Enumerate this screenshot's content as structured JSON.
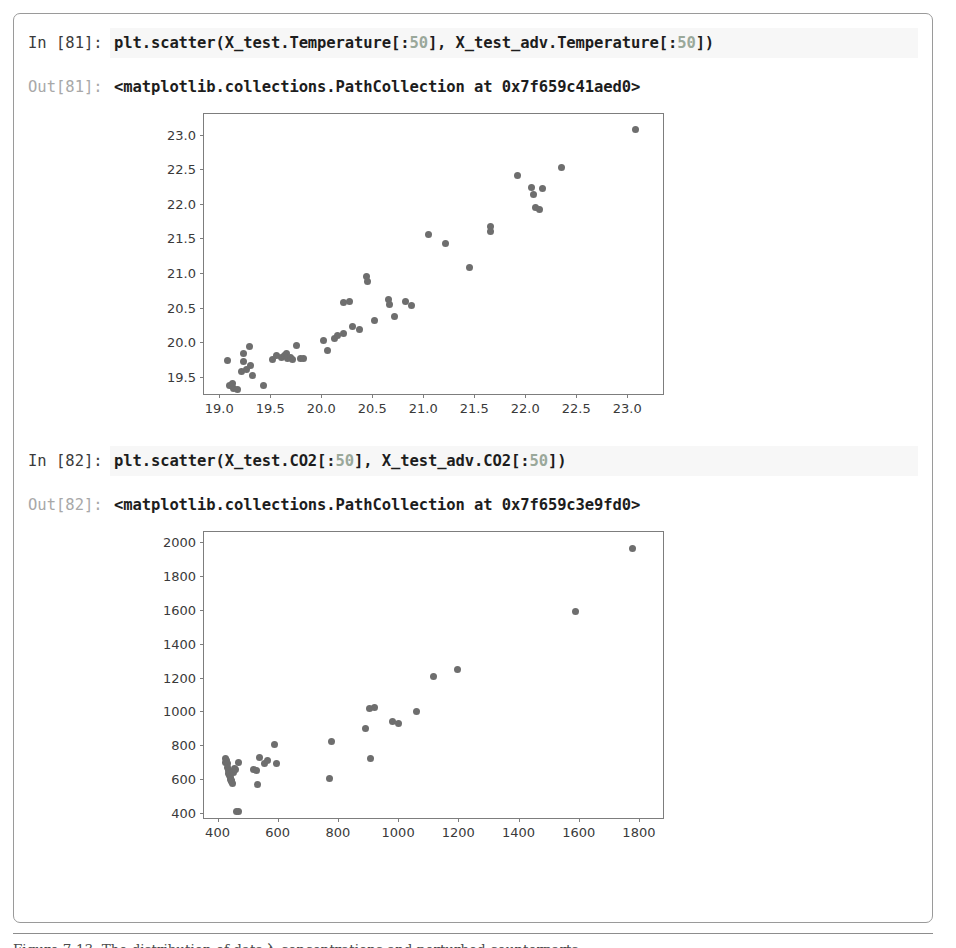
{
  "document": {
    "caption": "Figure 7-13. The distribution of data入 concentrations and perturbed counterparts"
  },
  "notebook": {
    "cells": [
      {
        "in_prompt": "In [81]:",
        "code_prefix": "plt.scatter(X_test.Temperature[:",
        "code_number": "50",
        "code_middle": "], X_test_adv.Temperature[:",
        "code_number2": "50",
        "code_suffix": "])",
        "out_prompt": "Out[81]:",
        "out_text": "<matplotlib.collections.PathCollection at 0x7f659c41aed0>"
      },
      {
        "in_prompt": "In [82]:",
        "code_prefix": "plt.scatter(X_test.CO2[:",
        "code_number": "50",
        "code_middle": "], X_test_adv.CO2[:",
        "code_number2": "50",
        "code_suffix": "])",
        "out_prompt": "Out[82]:",
        "out_text": "<matplotlib.collections.PathCollection at 0x7f659c3e9fd0>"
      }
    ]
  },
  "chart_data": [
    {
      "type": "scatter",
      "title": "",
      "xlabel": "",
      "ylabel": "",
      "xlim": [
        18.85,
        23.35
      ],
      "ylim": [
        19.25,
        23.3
      ],
      "xticks": [
        "19.0",
        "19.5",
        "20.0",
        "20.5",
        "21.0",
        "21.5",
        "22.0",
        "22.5",
        "23.0"
      ],
      "xtickvals": [
        19.0,
        19.5,
        20.0,
        20.5,
        21.0,
        21.5,
        22.0,
        22.5,
        23.0
      ],
      "yticks": [
        "19.5",
        "20.0",
        "20.5",
        "21.0",
        "21.5",
        "22.0",
        "22.5",
        "23.0"
      ],
      "ytickvals": [
        19.5,
        20.0,
        20.5,
        21.0,
        21.5,
        22.0,
        22.5,
        23.0
      ],
      "grid": false,
      "legend": null,
      "marker_color": "#6e6e6e",
      "points": [
        [
          19.08,
          19.73
        ],
        [
          19.1,
          19.37
        ],
        [
          19.13,
          19.4
        ],
        [
          19.14,
          19.33
        ],
        [
          19.18,
          19.32
        ],
        [
          19.24,
          19.84
        ],
        [
          19.24,
          19.72
        ],
        [
          19.22,
          19.57
        ],
        [
          19.27,
          19.6
        ],
        [
          19.3,
          19.93
        ],
        [
          19.31,
          19.66
        ],
        [
          19.33,
          19.52
        ],
        [
          19.43,
          19.37
        ],
        [
          19.52,
          19.75
        ],
        [
          19.56,
          19.8
        ],
        [
          19.61,
          19.78
        ],
        [
          19.64,
          19.8
        ],
        [
          19.66,
          19.84
        ],
        [
          19.67,
          19.76
        ],
        [
          19.7,
          19.78
        ],
        [
          19.72,
          19.75
        ],
        [
          19.76,
          19.95
        ],
        [
          19.8,
          19.76
        ],
        [
          19.83,
          19.76
        ],
        [
          20.02,
          20.02
        ],
        [
          20.06,
          19.88
        ],
        [
          20.13,
          20.05
        ],
        [
          20.16,
          20.09
        ],
        [
          20.22,
          20.13
        ],
        [
          20.22,
          20.58
        ],
        [
          20.28,
          20.59
        ],
        [
          20.31,
          20.22
        ],
        [
          20.37,
          20.19
        ],
        [
          20.44,
          20.95
        ],
        [
          20.45,
          20.88
        ],
        [
          20.52,
          20.32
        ],
        [
          20.66,
          20.62
        ],
        [
          20.67,
          20.54
        ],
        [
          20.72,
          20.37
        ],
        [
          20.83,
          20.59
        ],
        [
          20.88,
          20.53
        ],
        [
          21.05,
          21.56
        ],
        [
          21.22,
          21.43
        ],
        [
          21.45,
          21.08
        ],
        [
          21.66,
          21.68
        ],
        [
          21.66,
          21.6
        ],
        [
          21.92,
          22.41
        ],
        [
          22.06,
          22.24
        ],
        [
          22.08,
          22.13
        ],
        [
          22.1,
          21.95
        ],
        [
          22.14,
          21.92
        ],
        [
          22.17,
          22.22
        ],
        [
          22.35,
          22.53
        ],
        [
          23.08,
          23.08
        ]
      ]
    },
    {
      "type": "scatter",
      "title": "",
      "xlabel": "",
      "ylabel": "",
      "xlim": [
        355,
        1880
      ],
      "ylim": [
        370,
        2060
      ],
      "xticks": [
        "400",
        "600",
        "800",
        "1000",
        "1200",
        "1400",
        "1600",
        "1800"
      ],
      "xtickvals": [
        400,
        600,
        800,
        1000,
        1200,
        1400,
        1600,
        1800
      ],
      "yticks": [
        "400",
        "600",
        "800",
        "1000",
        "1200",
        "1400",
        "1600",
        "1800",
        "2000"
      ],
      "ytickvals": [
        400,
        600,
        800,
        1000,
        1200,
        1400,
        1600,
        1800,
        2000
      ],
      "grid": false,
      "legend": null,
      "marker_color": "#6e6e6e",
      "points": [
        [
          425,
          700
        ],
        [
          427,
          722
        ],
        [
          430,
          712
        ],
        [
          432,
          690
        ],
        [
          434,
          668
        ],
        [
          436,
          648
        ],
        [
          438,
          632
        ],
        [
          440,
          620
        ],
        [
          442,
          608
        ],
        [
          444,
          600
        ],
        [
          446,
          592
        ],
        [
          448,
          584
        ],
        [
          450,
          576
        ],
        [
          452,
          640
        ],
        [
          455,
          660
        ],
        [
          458,
          655
        ],
        [
          462,
          410
        ],
        [
          468,
          408
        ],
        [
          470,
          700
        ],
        [
          520,
          655
        ],
        [
          528,
          650
        ],
        [
          534,
          566
        ],
        [
          540,
          725
        ],
        [
          556,
          690
        ],
        [
          566,
          712
        ],
        [
          590,
          805
        ],
        [
          596,
          690
        ],
        [
          772,
          606
        ],
        [
          778,
          820
        ],
        [
          890,
          900
        ],
        [
          905,
          1018
        ],
        [
          908,
          722
        ],
        [
          920,
          1022
        ],
        [
          980,
          938
        ],
        [
          1000,
          930
        ],
        [
          1062,
          998
        ],
        [
          1118,
          1208
        ],
        [
          1198,
          1248
        ],
        [
          1588,
          1592
        ],
        [
          1778,
          1962
        ]
      ]
    }
  ]
}
